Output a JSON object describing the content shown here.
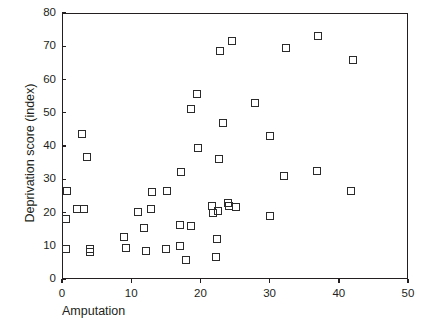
{
  "chart_data": {
    "type": "scatter",
    "title": "",
    "xlabel": "Amputation",
    "ylabel": "Deprivation score (index)",
    "xlim": [
      0,
      50
    ],
    "ylim": [
      0,
      80
    ],
    "xticks": [
      0,
      10,
      20,
      30,
      40,
      50
    ],
    "yticks": [
      0,
      10,
      20,
      30,
      40,
      50,
      60,
      70,
      80
    ],
    "grid": false,
    "legend": null,
    "marker": "open-square",
    "marker_color": "#2b2b2b",
    "points": [
      {
        "x": 0.6,
        "y": 18.0
      },
      {
        "x": 0.6,
        "y": 9.0
      },
      {
        "x": 0.7,
        "y": 26.5
      },
      {
        "x": 2.2,
        "y": 21.2
      },
      {
        "x": 2.9,
        "y": 43.6
      },
      {
        "x": 3.2,
        "y": 21.0
      },
      {
        "x": 4.0,
        "y": 8.0
      },
      {
        "x": 4.0,
        "y": 9.0
      },
      {
        "x": 3.6,
        "y": 36.8
      },
      {
        "x": 9.0,
        "y": 12.5
      },
      {
        "x": 9.2,
        "y": 9.2
      },
      {
        "x": 11.0,
        "y": 20.2
      },
      {
        "x": 11.9,
        "y": 15.2
      },
      {
        "x": 12.1,
        "y": 8.5
      },
      {
        "x": 12.9,
        "y": 21.0
      },
      {
        "x": 13.0,
        "y": 26.2
      },
      {
        "x": 15.0,
        "y": 9.0
      },
      {
        "x": 15.2,
        "y": 26.4
      },
      {
        "x": 17.0,
        "y": 10.0
      },
      {
        "x": 17.1,
        "y": 16.2
      },
      {
        "x": 17.2,
        "y": 32.2
      },
      {
        "x": 17.9,
        "y": 5.8
      },
      {
        "x": 18.6,
        "y": 16.0
      },
      {
        "x": 18.7,
        "y": 51.0
      },
      {
        "x": 19.5,
        "y": 55.6
      },
      {
        "x": 19.6,
        "y": 39.5
      },
      {
        "x": 21.7,
        "y": 22.0
      },
      {
        "x": 21.8,
        "y": 19.8
      },
      {
        "x": 22.2,
        "y": 6.5
      },
      {
        "x": 22.4,
        "y": 12.0
      },
      {
        "x": 22.6,
        "y": 20.5
      },
      {
        "x": 22.7,
        "y": 36.2
      },
      {
        "x": 22.9,
        "y": 68.5
      },
      {
        "x": 23.3,
        "y": 46.8
      },
      {
        "x": 24.0,
        "y": 23.0
      },
      {
        "x": 24.2,
        "y": 22.0
      },
      {
        "x": 24.6,
        "y": 71.5
      },
      {
        "x": 25.2,
        "y": 21.8
      },
      {
        "x": 27.9,
        "y": 53.0
      },
      {
        "x": 30.0,
        "y": 19.0
      },
      {
        "x": 30.1,
        "y": 43.0
      },
      {
        "x": 32.1,
        "y": 31.0
      },
      {
        "x": 32.3,
        "y": 69.5
      },
      {
        "x": 36.9,
        "y": 32.6
      },
      {
        "x": 37.0,
        "y": 73.0
      },
      {
        "x": 41.8,
        "y": 26.5
      },
      {
        "x": 42.0,
        "y": 66.0
      }
    ]
  },
  "axes": {
    "x_tick_labels": [
      "0",
      "10",
      "20",
      "30",
      "40",
      "50"
    ],
    "y_tick_labels": [
      "0",
      "10",
      "20",
      "30",
      "40",
      "50",
      "60",
      "70",
      "80"
    ]
  }
}
